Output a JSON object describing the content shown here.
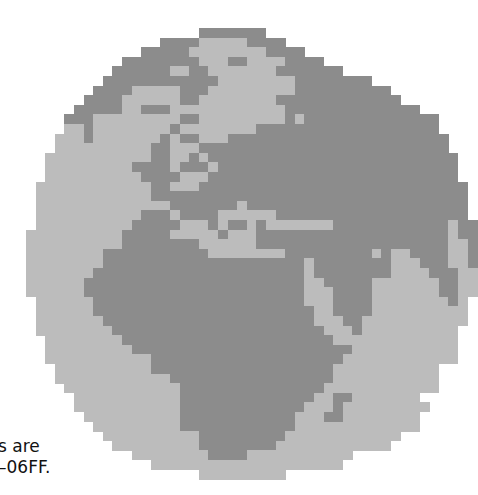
{
  "figure": {
    "colors": {
      "ocean": "#bcbcbc",
      "land": "#8c8c8c",
      "background": "#ffffff"
    },
    "cell_size": 9.6,
    "legend": {
      ".": "empty",
      "o": "ocean",
      "L": "land"
    },
    "rows": [
      "..................LLLLLLL....................",
      "..............LLLLoooooLLLL..................",
      "............LLLLLooooooooLLLL................",
      "..........LLLLLLLLoooLLooooLLLL..............",
      ".........LLLLLLooLLoooooooLLLLLLL............",
      "........LLLLLLLLLLLLooooooooLLLLLLLL..........",
      ".......LLLLoooooLLLoooooooooLLLLLLLLLL........",
      "......LLLLooooooLLooooooooLLLLLLLLLLLLL.......",
      ".....LLLLLooLLLooooooooooooLLLLLLLLLLLLLL.....",
      "....LLLoooooooooLLoooooooooLoLLLLLLLLLLLLLL...",
      "....ooLooooooooLooooooooLLLLLLLLLLLLLLLLLLL...",
      "...oooLoooooooLoLLoooLLLLLLLLLLLLLLLLLLLLLLL..",
      "...ooooooooooLLoooLLLLLLLLLLLLLLLLLLLLLLLLLL..",
      "..oooooooooooLLooLoLLLLLLLLLLLLLLLLLLLLLLLLLL.",
      "..oooooooooLLLLoLLLoLLLLLLLLLLLLLLLLLLLLLLLLL.",
      "..ooooooooooLLLLoooLLLLLLLLLLLLLLLLLLLLLLLLLL.",
      ".ooooooooooooLLoooLLLLLLLLLLLLLLLLLLLLLLLLLLLL",
      ".ooooooooooooLLLLLLLLLLLLLLLLLLLLLLLLLLLLLLLLL",
      ".ooooooooooooooLLLLLLLoLLLLLLLLLLLLLLLLLLLLLLL",
      ".oooooooooooLLLoLLLLooooooLLLLLLLLLLLLLLLLLLLL",
      ".ooooooooooLLLLLoooLoLLoLoooooooLLLLLLLLLLLLoLL",
      "ooooooooooLLLLLoooooLoooLLLLLLLLLLLLLLLLLLLLoLL",
      "ooooooooooLLLLLLLLooooooLLLLLLLLLLLLLLLLLLLLooL",
      "ooooooooLLLLLLLLLLLooooooooLLLLLLLLLoLooLLLLooL",
      "ooooooooLLLLLLLLLLLLLLLLLLLLLoLLLLLLLLoooLLLooL",
      "oooooooLLLLLLLLLLLLLLLLLLLLLLoLLLLLLLLooooLLLoo",
      "ooooooLLLLLLLLLLLLLLLLLLLLLLLooLLLLLoooooooLLoo",
      "ooooooLLLLLLLLLLLLLLLLLLLLLLLoooLLLLoooooooLLoo",
      ".ooooooLLLLLLLLLLLLLLLLLLLLLLoooLLLLooooooooLo.",
      ".ooooooLLLLLLLLLLLLLLLLLLLLLLLooLLLLoooooooooo.",
      ".oooooooLLLLLLLLLLLLLLLLLLLLLLoooLLooooooooooo.",
      ".ooooooooLLLLLLLLLLLLLLLLLLLLLLoooLoooooooooo..",
      "..ooooooooLLLLLLLLLLLLLLLLLLLLLLooooooooooooo..",
      "..oooooooooLLLLLLLLLLLLLLLLLLLLLLLooooooooooo..",
      "..oooooooooooLLLLLLLLLLLLLLLLLLLLoooooooooooo..",
      "...ooooooooooLLLLLLLLLLLLLLLLLLLooooooooooo...",
      "...ooooooooooooLLLLLLLLLLLLLLLLLooooooooooo...",
      "....ooooooooooooLLLLLLLLLLLLLLLoooooooooooo...",
      ".....oooooooooooLLLLLLLLLLLLLLooLLooooooo.....",
      ".....oooooooooooLLLLLLLLLLLLLoooLooooooooo....",
      "......ooooooooooLLLLLLLLLLLLoooLLoooooooo.....",
      ".......oooooooooLLLLLLLLLLLLooooooooooooo.....",
      "........ooooooooooLLLLLLLLLoooooooooooo.......",
      ".........oooooooooLLLLLLLLoooooooooooo........",
      "...........ooooooooLLLLooooooooooo............",
      ".............oooooooooooooooooooo.............",
      "..................ooooooooo..................."
    ]
  },
  "caption": {
    "line1": "s are",
    "line2": "–06FF."
  }
}
